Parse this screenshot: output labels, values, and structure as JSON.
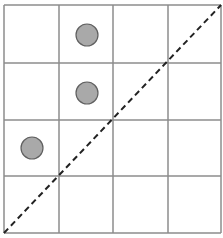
{
  "canvas": {
    "width": 223,
    "height": 238,
    "background": "#ffffff"
  },
  "grid": {
    "rows": 4,
    "cols": 4,
    "x_lines": [
      4,
      59,
      113,
      168,
      221
    ],
    "y_lines": [
      5,
      63,
      120,
      176,
      233
    ],
    "line_color": "#8c8c8c",
    "line_width": 1.5
  },
  "diagonal": {
    "from": [
      4,
      233
    ],
    "to": [
      221,
      5
    ],
    "color": "#222222",
    "width": 2,
    "dash": "6 4",
    "style": "dashed"
  },
  "points": [
    {
      "label": "point-1",
      "row": 0,
      "col": 1,
      "cx": 87,
      "cy": 35,
      "r": 11
    },
    {
      "label": "point-2",
      "row": 1,
      "col": 1,
      "cx": 87,
      "cy": 93,
      "r": 11
    },
    {
      "label": "point-3",
      "row": 2,
      "col": 0,
      "cx": 32,
      "cy": 148,
      "r": 11
    }
  ],
  "point_style": {
    "fill": "#a9a9a9",
    "stroke": "#606060",
    "stroke_width": 1.2
  }
}
